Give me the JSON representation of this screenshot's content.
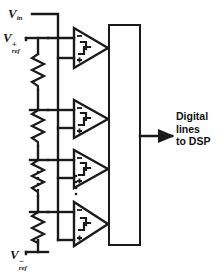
{
  "diagram": {
    "labels": {
      "v_in": "V",
      "v_in_sub": "in",
      "v_ref_plus": "V",
      "v_ref_plus_sub": "ref",
      "v_ref_plus_sup": "+",
      "v_ref_minus": "V",
      "v_ref_minus_sub": "ref",
      "v_ref_minus_sup": "−",
      "encoder": "Priority encoder",
      "output": "Digital lines to DSP",
      "output_line1": "Digital",
      "output_line2": "lines",
      "output_line3": "to DSP"
    },
    "comparators": [
      {
        "name": "comparator-1",
        "minus": "−",
        "plus": "+",
        "symbol": "step-transfer-icon"
      },
      {
        "name": "comparator-2",
        "minus": "−",
        "plus": "+",
        "symbol": "step-transfer-icon"
      },
      {
        "name": "comparator-3",
        "minus": "−",
        "plus": "+",
        "symbol": "step-transfer-icon"
      },
      {
        "name": "comparator-4",
        "minus": "−",
        "plus": "+",
        "symbol": "step-transfer-icon"
      }
    ],
    "resistor_ladder": {
      "name": "resistor-ladder",
      "resistor_count": 5,
      "ellipsis": "⋮"
    },
    "colors": {
      "line": "#1a1a1a",
      "background": "#ffffff",
      "text": "#111111"
    }
  }
}
